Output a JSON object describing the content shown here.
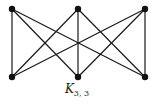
{
  "graph": {
    "name": "K",
    "subscript": "3, 3",
    "top_nodes": [
      "a1",
      "a2",
      "a3"
    ],
    "bottom_nodes": [
      "b1",
      "b2",
      "b3"
    ],
    "edges": [
      [
        "a1",
        "b1"
      ],
      [
        "a1",
        "b2"
      ],
      [
        "a1",
        "b3"
      ],
      [
        "a2",
        "b1"
      ],
      [
        "a2",
        "b2"
      ],
      [
        "a2",
        "b3"
      ],
      [
        "a3",
        "b1"
      ],
      [
        "a3",
        "b2"
      ],
      [
        "a3",
        "b3"
      ]
    ],
    "colors": {
      "edge": "#1a1a1a",
      "node": "#111111"
    }
  }
}
